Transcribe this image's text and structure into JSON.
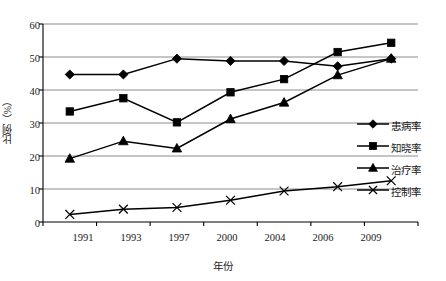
{
  "chart_data": {
    "type": "line",
    "title": "",
    "xlabel": "年份",
    "ylabel": "比例（%）",
    "categories": [
      "1991",
      "1993",
      "1997",
      "2000",
      "2004",
      "2006",
      "2009"
    ],
    "ylim": [
      0,
      60
    ],
    "yticks": [
      "0",
      "10",
      "20",
      "30",
      "40",
      "50",
      "60"
    ],
    "grid": "horizontal",
    "legend_position": "right-inside",
    "series": [
      {
        "name": "患病率",
        "marker": "diamond",
        "values": [
          44.7,
          44.7,
          49.5,
          48.8,
          48.8,
          47.2,
          49.5
        ]
      },
      {
        "name": "知晓率",
        "marker": "square",
        "values": [
          33.5,
          37.5,
          30.2,
          39.3,
          43.3,
          51.5,
          54.3
        ]
      },
      {
        "name": "治疗率",
        "marker": "triangle",
        "values": [
          19.2,
          24.5,
          22.3,
          31.2,
          36.2,
          44.5,
          49.5
        ]
      },
      {
        "name": "控制率",
        "marker": "cross",
        "values": [
          2.3,
          3.9,
          4.4,
          6.6,
          9.4,
          10.7,
          12.5
        ]
      }
    ]
  },
  "axis": {
    "y_title": "比例（%）",
    "x_title": "年份",
    "y_tick_0": "0",
    "y_tick_10": "10",
    "y_tick_20": "20",
    "y_tick_30": "30",
    "y_tick_40": "40",
    "y_tick_50": "50",
    "y_tick_60": "60",
    "x_tick_0": "1991",
    "x_tick_1": "1993",
    "x_tick_2": "1997",
    "x_tick_3": "2000",
    "x_tick_4": "2004",
    "x_tick_5": "2006",
    "x_tick_6": "2009"
  },
  "legend": {
    "item_0": "患病率",
    "item_1": "知晓率",
    "item_2": "治疗率",
    "item_3": "控制率"
  },
  "colors": {
    "series_line": "#000000",
    "marker_fill": "#000000",
    "gridline": "#8c8c8c",
    "axis": "#000000",
    "background": "#ffffff"
  }
}
